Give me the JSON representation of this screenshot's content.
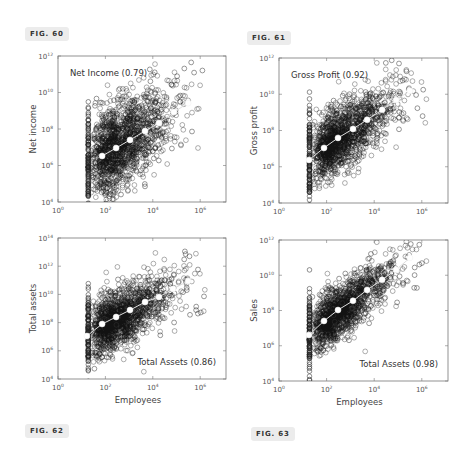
{
  "figures": [
    {
      "id": "fig60",
      "label": "FIG. 60",
      "left": 25,
      "top": 27
    },
    {
      "id": "fig61",
      "label": "FIG. 61",
      "left": 247,
      "top": 31
    },
    {
      "id": "fig62",
      "label": "FIG. 62",
      "left": 25,
      "top": 424
    },
    {
      "id": "fig63",
      "label": "FIG. 63",
      "left": 251,
      "top": 427
    }
  ],
  "chart_data": [
    {
      "type": "scatter",
      "title": "Net Income (0.79)",
      "annotation": "Net Income (0.79)",
      "annotation_position": "top-left",
      "xlabel": "",
      "ylabel": "Net income",
      "xscale": "log",
      "yscale": "log",
      "xlim": [
        1,
        12589254
      ],
      "ylim": [
        10000,
        1000000000000
      ],
      "xticks": [
        "10^0",
        "10^2",
        "10^4",
        "10^6"
      ],
      "yticks": [
        "10^4",
        "10^6",
        "10^8",
        "10^10",
        "10^12"
      ],
      "correlation": 0.79,
      "series": [
        {
          "name": "companies",
          "marker": "open-circle",
          "description": "dense cloud of firm observations; vertical column at ~10^1.3 employees"
        },
        {
          "name": "binned-mean",
          "marker": "white-dot",
          "line": true,
          "log10_x": [
            1.86,
            2.45,
            3.04,
            3.67,
            4.26,
            4.89,
            5.49
          ],
          "log10_y": [
            6.52,
            6.96,
            7.4,
            7.89,
            8.33,
            8.93,
            9.42
          ]
        }
      ],
      "box": {
        "x": 58,
        "y": 56,
        "w": 168,
        "h": 146
      },
      "ydec": [
        4,
        12
      ],
      "xdec_px": 23.7
    },
    {
      "type": "scatter",
      "title": "Gross Profit (0.92)",
      "annotation": "Gross Profit (0.92)",
      "annotation_position": "top-left",
      "xlabel": "",
      "ylabel": "Gross profit",
      "xscale": "log",
      "yscale": "log",
      "xlim": [
        1,
        12589254
      ],
      "ylim": [
        10000,
        1000000000000
      ],
      "xticks": [
        "10^0",
        "10^2",
        "10^4",
        "10^6"
      ],
      "yticks": [
        "10^4",
        "10^6",
        "10^8",
        "10^10",
        "10^12"
      ],
      "correlation": 0.92,
      "series": [
        {
          "name": "companies",
          "marker": "open-circle",
          "description": "dense cloud of firm observations; vertical column at ~10^1.3 employees"
        },
        {
          "name": "binned-mean",
          "marker": "white-dot",
          "line": true,
          "log10_x": [
            1.26,
            1.89,
            2.48,
            3.11,
            3.7,
            4.33,
            4.92,
            5.5
          ],
          "log10_y": [
            6.38,
            7.04,
            7.59,
            8.09,
            8.59,
            9.14,
            9.69,
            10.19
          ]
        }
      ],
      "box": {
        "x": 279,
        "y": 58,
        "w": 169,
        "h": 145
      },
      "ydec": [
        4,
        12
      ],
      "xdec_px": 23.8
    },
    {
      "type": "scatter",
      "title": "Total Assets (0.86)",
      "annotation": "Total Assets (0.86)",
      "annotation_position": "bottom-right",
      "xlabel": "Employees",
      "ylabel": "Total assets",
      "xscale": "log",
      "yscale": "log",
      "xlim": [
        1,
        12589254
      ],
      "ylim": [
        10000,
        100000000000000
      ],
      "xticks": [
        "10^0",
        "10^2",
        "10^4",
        "10^6"
      ],
      "yticks": [
        "10^4",
        "10^6",
        "10^8",
        "10^10",
        "10^12",
        "10^14"
      ],
      "correlation": 0.86,
      "series": [
        {
          "name": "companies",
          "marker": "open-circle",
          "description": "dense cloud of firm observations; vertical column at ~10^1.3 employees"
        },
        {
          "name": "binned-mean",
          "marker": "white-dot",
          "line": true,
          "log10_x": [
            1.22,
            1.86,
            2.45,
            3.04,
            3.67,
            4.26,
            4.85,
            5.49
          ],
          "log10_y": [
            7.05,
            7.9,
            8.4,
            8.89,
            9.46,
            9.82,
            10.38,
            10.95
          ]
        }
      ],
      "box": {
        "x": 58,
        "y": 238,
        "w": 168,
        "h": 141
      },
      "ydec": [
        4,
        14
      ],
      "xdec_px": 23.7
    },
    {
      "type": "scatter",
      "title": "Total Assets (0.98)",
      "annotation": "Total Assets (0.98)",
      "annotation_position": "bottom-right",
      "xlabel": "Employees",
      "ylabel": "Sales",
      "xscale": "log",
      "yscale": "log",
      "xlim": [
        1,
        12589254
      ],
      "ylim": [
        10000,
        1000000000000
      ],
      "xticks": [
        "10^0",
        "10^2",
        "10^4",
        "10^6"
      ],
      "yticks": [
        "10^4",
        "10^6",
        "10^8",
        "10^10",
        "10^12"
      ],
      "correlation": 0.98,
      "series": [
        {
          "name": "companies",
          "marker": "open-circle",
          "description": "dense cloud of firm observations; vertical column at ~10^1.3 employees"
        },
        {
          "name": "binned-mean",
          "marker": "white-dot",
          "line": true,
          "log10_x": [
            1.26,
            1.89,
            2.48,
            3.11,
            3.7,
            4.33,
            4.92,
            5.5
          ],
          "log10_y": [
            6.61,
            7.41,
            8.03,
            8.55,
            9.17,
            9.74,
            10.31,
            10.99
          ]
        }
      ],
      "box": {
        "x": 279,
        "y": 240,
        "w": 169,
        "h": 141
      },
      "ydec": [
        4,
        12
      ],
      "xdec_px": 23.8
    }
  ]
}
